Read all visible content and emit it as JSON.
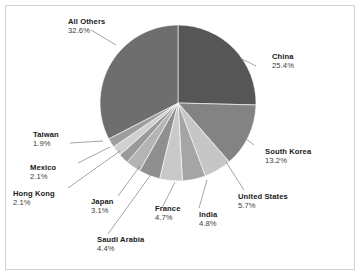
{
  "chart_data": {
    "type": "pie",
    "title": "",
    "subtitle": "",
    "xlabel": "",
    "ylabel": "",
    "legend_position": "callout-labels",
    "grid": false,
    "start_angle_deg": 0,
    "direction": "clockwise",
    "unit": "%",
    "categories": [
      "China",
      "South Korea",
      "United States",
      "India",
      "France",
      "Saudi Arabia",
      "Japan",
      "Hong Kong",
      "Mexico",
      "Taiwan",
      "All Others"
    ],
    "values": [
      25.4,
      13.2,
      5.7,
      4.8,
      4.7,
      4.4,
      3.1,
      2.1,
      2.1,
      1.9,
      32.6
    ],
    "slices": [
      {
        "label": "China",
        "value": 25.4,
        "value_text": "25.4%",
        "color": "#565656"
      },
      {
        "label": "South Korea",
        "value": 13.2,
        "value_text": "13.2%",
        "color": "#838383"
      },
      {
        "label": "United States",
        "value": 5.7,
        "value_text": "5.7%",
        "color": "#c6c6c6"
      },
      {
        "label": "India",
        "value": 4.8,
        "value_text": "4.8%",
        "color": "#a5a5a5"
      },
      {
        "label": "France",
        "value": 4.7,
        "value_text": "4.7%",
        "color": "#c9c9c9"
      },
      {
        "label": "Saudi Arabia",
        "value": 4.4,
        "value_text": "4.4%",
        "color": "#8f8f8f"
      },
      {
        "label": "Japan",
        "value": 3.1,
        "value_text": "3.1%",
        "color": "#b4b4b4"
      },
      {
        "label": "Hong Kong",
        "value": 2.1,
        "value_text": "2.1%",
        "color": "#9a9a9a"
      },
      {
        "label": "Mexico",
        "value": 2.1,
        "value_text": "2.1%",
        "color": "#d0d0d0"
      },
      {
        "label": "Taiwan",
        "value": 1.9,
        "value_text": "1.9%",
        "color": "#9e9e9e"
      },
      {
        "label": "All Others",
        "value": 32.6,
        "value_text": "32.6%",
        "color": "#6e6e6e"
      }
    ]
  },
  "labels": {
    "all_others": {
      "name": "All Others",
      "value": "32.6%"
    },
    "china": {
      "name": "China",
      "value": "25.4%"
    },
    "south_korea": {
      "name": "South Korea",
      "value": "13.2%"
    },
    "united_states": {
      "name": "United States",
      "value": "5.7%"
    },
    "india": {
      "name": "India",
      "value": "4.8%"
    },
    "france": {
      "name": "France",
      "value": "4.7%"
    },
    "saudi_arabia": {
      "name": "Saudi Arabia",
      "value": "4.4%"
    },
    "japan": {
      "name": "Japan",
      "value": "3.1%"
    },
    "hong_kong": {
      "name": "Hong Kong",
      "value": "2.1%"
    },
    "mexico": {
      "name": "Mexico",
      "value": "2.1%"
    },
    "taiwan": {
      "name": "Taiwan",
      "value": "1.9%"
    }
  },
  "style": {
    "background": "#ffffff",
    "border_color": "#d2d2d2",
    "leader_line_color": "#8c8c8c",
    "name_color": "#1a1a1a",
    "value_color": "#3b3b3b"
  },
  "geometry": {
    "center_x": 178,
    "center_y": 103,
    "radius": 78
  }
}
